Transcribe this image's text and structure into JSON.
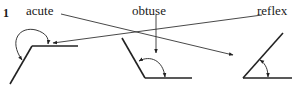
{
  "question": {
    "number": "1",
    "labels": {
      "acute": "acute",
      "obtuse": "obtuse",
      "reflex": "reflex"
    },
    "figures": [
      {
        "name": "reflex-angle-figure",
        "arc": "reflex"
      },
      {
        "name": "obtuse-angle-figure",
        "arc": "obtuse"
      },
      {
        "name": "acute-angle-figure",
        "arc": "acute"
      }
    ],
    "matching_lines": [
      {
        "from": "acute",
        "to": "acute-angle-figure"
      },
      {
        "from": "obtuse",
        "to": "obtuse-angle-figure"
      },
      {
        "from": "reflex",
        "to": "reflex-angle-figure"
      }
    ]
  },
  "colors": {
    "ink": "#1a1a1a",
    "line": "#333333"
  }
}
